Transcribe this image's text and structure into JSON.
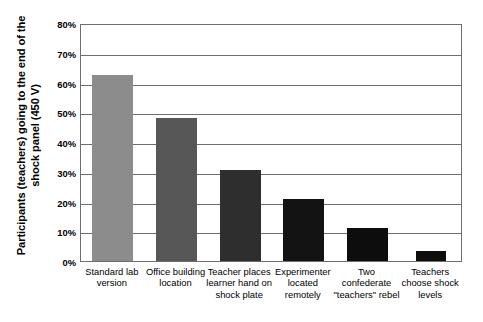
{
  "chart_data": {
    "type": "bar",
    "title": "",
    "xlabel": "",
    "ylabel_line1": "Participants (teachers) going to the end of the",
    "ylabel_line2": "shock panel (450 V)",
    "ylabel": "Participants (teachers) going to the end of the shock panel (450 V)",
    "categories": [
      "Standard lab\nversion",
      "Office building\nlocation",
      "Teacher places\nlearner hand on\nshock plate",
      "Experimenter\nlocated\nremotely",
      "Two\nconfederate\n\"teachers\" rebel",
      "Teachers\nchoose shock\nlevels"
    ],
    "values": [
      62.5,
      48,
      30.5,
      21,
      11,
      3.5
    ],
    "value_labels": [
      "62.5%",
      "48%",
      "30.5%",
      "21%",
      "11%",
      "3.5%"
    ],
    "bar_colors": [
      "#8c8c8c",
      "#575757",
      "#2e2e2e",
      "#131313",
      "#0d0d0d",
      "#0d0d0d"
    ],
    "ylim": [
      0,
      80
    ],
    "ytick_values": [
      0,
      10,
      20,
      30,
      40,
      50,
      60,
      70,
      80
    ],
    "ytick_labels": [
      "0%",
      "10%",
      "20%",
      "30%",
      "40%",
      "50%",
      "60%",
      "70%",
      "80%"
    ],
    "grid": true,
    "grid_axis": "y",
    "grid_color": "#6e6e6e",
    "legend": "none",
    "background_color": "#ffffff",
    "frame_color": "#6e6e6e"
  }
}
